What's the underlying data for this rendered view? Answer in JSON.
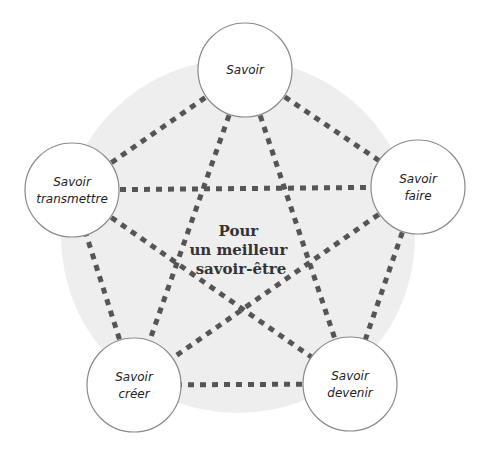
{
  "diagram": {
    "type": "pentagram-network",
    "center_label": [
      "Pour",
      "un meilleur",
      "savoir-être"
    ],
    "colors": {
      "background_disc": "#eeeeee",
      "node_fill": "#ffffff",
      "node_stroke": "#8a8a8a",
      "dotted_line": "#555555",
      "text": "#222222"
    },
    "nodes": [
      {
        "id": "savoir",
        "lines": [
          "Savoir"
        ],
        "cx": 245,
        "cy": 70
      },
      {
        "id": "savoir-faire",
        "lines": [
          "Savoir",
          "faire"
        ],
        "cx": 418,
        "cy": 187
      },
      {
        "id": "savoir-devenir",
        "lines": [
          "Savoir",
          "devenir"
        ],
        "cx": 350,
        "cy": 384
      },
      {
        "id": "savoir-creer",
        "lines": [
          "Savoir",
          "créer"
        ],
        "cx": 134,
        "cy": 385
      },
      {
        "id": "savoir-transmettre",
        "lines": [
          "Savoir",
          "transmettre"
        ],
        "cx": 72,
        "cy": 190
      }
    ],
    "edges": [
      [
        "savoir",
        "savoir-faire"
      ],
      [
        "savoir-faire",
        "savoir-devenir"
      ],
      [
        "savoir-devenir",
        "savoir-creer"
      ],
      [
        "savoir-creer",
        "savoir-transmettre"
      ],
      [
        "savoir-transmettre",
        "savoir"
      ],
      [
        "savoir",
        "savoir-devenir"
      ],
      [
        "savoir",
        "savoir-creer"
      ],
      [
        "savoir-transmettre",
        "savoir-faire"
      ],
      [
        "savoir-transmettre",
        "savoir-devenir"
      ],
      [
        "savoir-faire",
        "savoir-creer"
      ]
    ]
  }
}
